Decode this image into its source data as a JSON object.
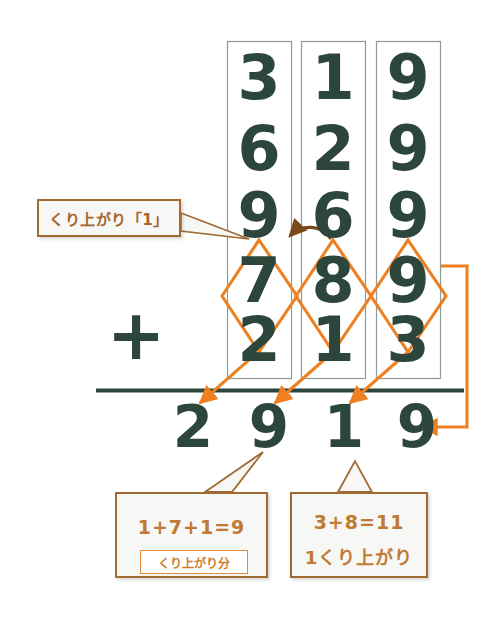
{
  "figure": {
    "kind": "vertical-addition-worksheet",
    "colors": {
      "digit": "#2d463c",
      "orange": "#ee8022",
      "callout_border": "#a06a33",
      "callout_text": "#b4702f",
      "callout_fill": "#f7f7f5",
      "column_box_border": "#8e9a96",
      "carry_arrow": "#7a4a18",
      "page_background": "#ffffff"
    },
    "operator": "+",
    "columns": [
      {
        "name": "hundreds",
        "top_digit": "3",
        "mid_digit": "6",
        "upper": "9",
        "addend_upper": "7",
        "addend_lower": "2"
      },
      {
        "name": "tens",
        "top_digit": "1",
        "mid_digit": "2",
        "upper": "6",
        "addend_upper": "8",
        "addend_lower": "1"
      },
      {
        "name": "ones",
        "top_digit": "9",
        "mid_digit": "9",
        "upper": "9",
        "addend_upper": "9",
        "addend_lower": "3"
      }
    ],
    "stacked_rows": [
      {
        "label": "row-1",
        "digits": [
          "3",
          "1",
          "9"
        ]
      },
      {
        "label": "row-2",
        "digits": [
          "6",
          "2",
          "9"
        ]
      },
      {
        "label": "row-3",
        "digits": [
          "9",
          "6",
          "9"
        ]
      },
      {
        "label": "row-4",
        "digits": [
          "7",
          "8",
          "9"
        ]
      },
      {
        "label": "row-5",
        "digits": [
          "2",
          "1",
          "3"
        ]
      }
    ],
    "answer": {
      "label": "sum",
      "digits": [
        "2",
        "9",
        "1",
        "9"
      ]
    },
    "callouts": {
      "carry_label": "くり上がり「1」",
      "ones_equation": "1+7+1=9",
      "ones_inner_tag": "くり上がり分",
      "tens_equation": "3+8=11",
      "tens_note": "1くり上がり"
    },
    "annotations": {
      "diamond_count": "3",
      "arrow_count": "4",
      "carry_arrow_direction": "right-to-left"
    }
  }
}
